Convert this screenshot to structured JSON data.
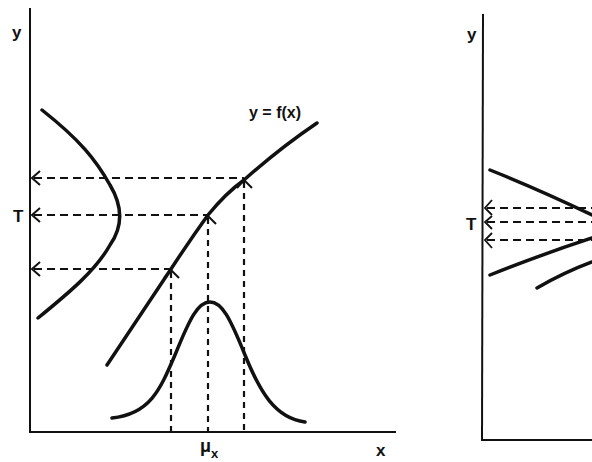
{
  "left_panel": {
    "y_axis_label": "y",
    "x_axis_label": "x",
    "curve_label": "y = f(x)",
    "target_label": "T",
    "mean_label": "μ",
    "mean_subscript": "x"
  },
  "right_panel": {
    "y_axis_label": "y",
    "target_label": "T"
  },
  "colors": {
    "ink": "#111111",
    "background": "#ffffff"
  }
}
